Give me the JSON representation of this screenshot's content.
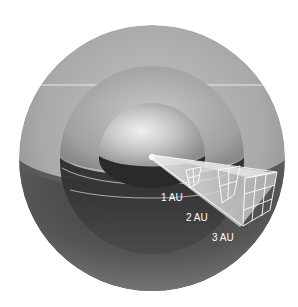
{
  "diagram": {
    "labels": [
      {
        "id": "au1",
        "text": "1 AU"
      },
      {
        "id": "au2",
        "text": "2 AU"
      },
      {
        "id": "au3",
        "text": "3 AU"
      }
    ],
    "colors": {
      "background": "#ffffff",
      "outer_sphere_light": "#b0b0b0",
      "outer_sphere_dark": "#4a4a4a",
      "middle_sphere_light": "#a8a8a8",
      "inner_sphere_highlight": "#e6e6e6",
      "cut_interior_dark": "#2c2c2c",
      "wedge_fill": "#d8d8d8",
      "grid_lines": "#ffffff",
      "label_text": "#ffffff"
    }
  }
}
